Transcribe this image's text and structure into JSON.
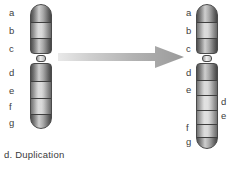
{
  "figure": {
    "caption": "d. Duplication",
    "type": "chromosome-mutation-diagram",
    "arrow_icon": "right-arrow-icon",
    "colors": {
      "band_outline": "#4a4a4a",
      "band_dark": "#6e6e6e",
      "band_light": "#c9c9c9",
      "label_text": "#3d3d3d",
      "arrow": "#a8a8a8",
      "background": "#ffffff"
    }
  },
  "original_chromosome": {
    "name": "original-chromosome",
    "short_arm_labels": [
      "a",
      "b",
      "c"
    ],
    "long_arm_labels": [
      "d",
      "e",
      "f",
      "g"
    ],
    "bands": [
      {
        "label": "a",
        "arm": "short",
        "shade": "dark"
      },
      {
        "label": "b",
        "arm": "short",
        "shade": "light"
      },
      {
        "label": "c",
        "arm": "short",
        "shade": "dark"
      },
      {
        "label": "d",
        "arm": "long",
        "shade": "dark"
      },
      {
        "label": "e",
        "arm": "long",
        "shade": "light"
      },
      {
        "label": "f",
        "arm": "long",
        "shade": "light"
      },
      {
        "label": "g",
        "arm": "long",
        "shade": "dark"
      }
    ]
  },
  "duplicated_chromosome": {
    "name": "duplicated-chromosome",
    "short_arm_labels": [
      "a",
      "b",
      "c"
    ],
    "long_arm_labels_left": [
      "d",
      "e",
      "f",
      "g"
    ],
    "duplicated_segment_labels": [
      "d",
      "e"
    ],
    "bands": [
      {
        "label": "a",
        "arm": "short",
        "shade": "dark"
      },
      {
        "label": "b",
        "arm": "short",
        "shade": "light"
      },
      {
        "label": "c",
        "arm": "short",
        "shade": "dark"
      },
      {
        "label": "d",
        "arm": "long",
        "shade": "dark"
      },
      {
        "label": "e",
        "arm": "long",
        "shade": "light"
      },
      {
        "label": "d",
        "arm": "long",
        "shade": "duplicated"
      },
      {
        "label": "e",
        "arm": "long",
        "shade": "duplicated"
      },
      {
        "label": "f",
        "arm": "long",
        "shade": "light"
      },
      {
        "label": "g",
        "arm": "long",
        "shade": "dark"
      }
    ]
  }
}
